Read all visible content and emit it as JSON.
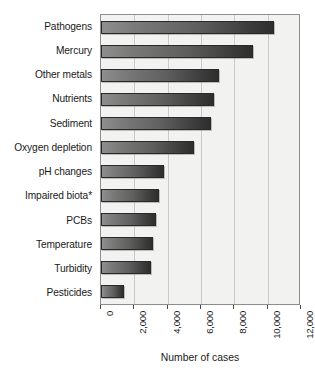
{
  "chart_data": {
    "type": "bar",
    "orientation": "horizontal",
    "title": "",
    "xlabel": "Number of cases",
    "ylabel": "",
    "xlim": [
      0,
      12000
    ],
    "ylim": null,
    "grid": true,
    "legend": null,
    "xticks": [
      "0",
      "2,000",
      "4,000",
      "6,000",
      "8,000",
      "10,000",
      "12,000"
    ],
    "xtick_values": [
      0,
      2000,
      4000,
      6000,
      8000,
      10000,
      12000
    ],
    "categories": [
      "Pathogens",
      "Mercury",
      "Other metals",
      "Nutrients",
      "Sediment",
      "Oxygen depletion",
      "pH changes",
      "Impaired biota*",
      "PCBs",
      "Temperature",
      "Turbidity",
      "Pesticides"
    ],
    "values": [
      10400,
      9100,
      7100,
      6800,
      6600,
      5600,
      3800,
      3500,
      3300,
      3100,
      3000,
      1400
    ],
    "colors": {
      "bar_gradient_light": "#8e8e8e",
      "bar_gradient_dark": "#2e2e2e",
      "bar_outline": "#2a2a2a",
      "plot_background": "#f2f2f1",
      "gridline": "#c9c9c7",
      "axis": "#8d8d8d",
      "text": "#1a1a1a"
    }
  }
}
